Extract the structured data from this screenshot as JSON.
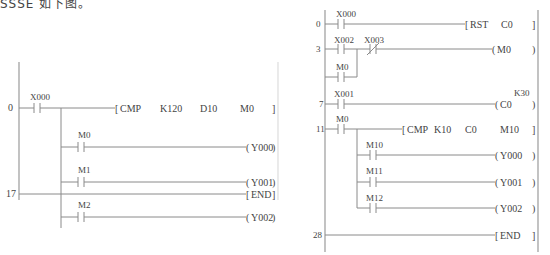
{
  "caption": "SSSE 如下图。",
  "left_diagram": {
    "rungs": [
      {
        "step": "0",
        "contact": "X000",
        "instruction": "CMP",
        "operands": [
          "K120",
          "D10",
          "M0"
        ]
      },
      {
        "branch_contact": "M0",
        "coil": "Y000"
      },
      {
        "branch_contact": "M1",
        "coil": "Y001"
      },
      {
        "branch_contact": "M2",
        "coil": "Y002"
      },
      {
        "step": "17",
        "instruction": "END"
      }
    ]
  },
  "right_diagram": {
    "rungs": [
      {
        "step": "0",
        "contact": "X000",
        "instruction": "RST",
        "operand": "C0"
      },
      {
        "step": "3",
        "contact": "X002",
        "nc_contact": "X003",
        "parallel_contact": "M0",
        "coil": "M0"
      },
      {
        "step": "7",
        "contact": "X001",
        "coil": "C0",
        "preset": "K30"
      },
      {
        "step": "11",
        "contact": "M0",
        "instruction": "CMP",
        "operands": [
          "K10",
          "C0",
          "M10"
        ]
      },
      {
        "branch_contact": "M10",
        "coil": "Y000"
      },
      {
        "branch_contact": "M11",
        "coil": "Y001"
      },
      {
        "branch_contact": "M12",
        "coil": "Y002"
      },
      {
        "step": "28",
        "instruction": "END"
      }
    ]
  }
}
